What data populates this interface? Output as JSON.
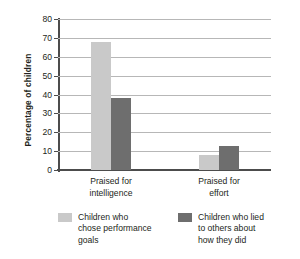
{
  "chart_data": {
    "type": "bar",
    "title": "",
    "xlabel": "",
    "ylabel": "Percentage of children",
    "categories": [
      "Praised for\nintelligence",
      "Praised for\neffort"
    ],
    "category_labels_flat": [
      "Praised for intelligence",
      "Praised for effort"
    ],
    "ylim": [
      0,
      80
    ],
    "ytick_labels": [
      "80",
      "70",
      "60",
      "50",
      "40",
      "30",
      "20",
      "10",
      "0"
    ],
    "ytick_values": [
      80,
      70,
      60,
      50,
      40,
      30,
      20,
      10,
      0
    ],
    "grid": true,
    "legend_position": "bottom",
    "series": [
      {
        "name": "Children who\nchose performance\ngoals",
        "name_flat": "Children who chose performance goals",
        "color": "#c9c9c9",
        "values": [
          68,
          8
        ]
      },
      {
        "name": "Children who lied\nto others about\nhow they did",
        "name_flat": "Children who lied to others about how they did",
        "color": "#6e6e6e",
        "values": [
          38,
          12.5
        ]
      }
    ]
  },
  "style": {
    "axis_color": "#4c4c4c",
    "grid_color": "#b7b7b7",
    "text_color": "#231f20",
    "background": "#ffffff"
  }
}
